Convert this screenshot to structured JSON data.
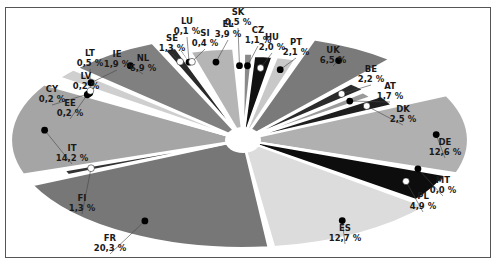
{
  "chart_data": {
    "type": "pie",
    "title": "",
    "style": "exploded elliptical pie with center hole, marker dots per slice",
    "unit": "%",
    "slices": [
      {
        "label": "HU",
        "value": 2.0,
        "value_text": "2,0 %",
        "color": "#111111",
        "dot": "white"
      },
      {
        "label": "PT",
        "value": 2.1,
        "value_text": "2,1 %",
        "color": "#c8c8c8",
        "dot": "black"
      },
      {
        "label": "UK",
        "value": 6.5,
        "value_text": "6,5 %",
        "color": "#7a7a7a",
        "dot": "black"
      },
      {
        "label": "BE",
        "value": 2.2,
        "value_text": "2,2 %",
        "color": "#2b2b2b",
        "dot": "white"
      },
      {
        "label": "AT",
        "value": 1.7,
        "value_text": "1,7 %",
        "color": "#9a9a9a",
        "dot": "black"
      },
      {
        "label": "DK",
        "value": 2.5,
        "value_text": "2,5 %",
        "color": "#1e1e1e",
        "dot": "white"
      },
      {
        "label": "DE",
        "value": 12.6,
        "value_text": "12,6 %",
        "color": "#b0b0b0",
        "dot": "black"
      },
      {
        "label": "MT",
        "value": 0.0,
        "value_text": "0,0 %",
        "color": "#444444",
        "dot": "black"
      },
      {
        "label": "PL",
        "value": 4.9,
        "value_text": "4,9 %",
        "color": "#0d0d0d",
        "dot": "white"
      },
      {
        "label": "ES",
        "value": 12.7,
        "value_text": "12,7 %",
        "color": "#dcdcdc",
        "dot": "black"
      },
      {
        "label": "FR",
        "value": 20.3,
        "value_text": "20,3 %",
        "color": "#777777",
        "dot": "black"
      },
      {
        "label": "FI",
        "value": 1.3,
        "value_text": "1,3 %",
        "color": "#333333",
        "dot": "white"
      },
      {
        "label": "IT",
        "value": 14.2,
        "value_text": "14,2 %",
        "color": "#a5a5a5",
        "dot": "black"
      },
      {
        "label": "EE",
        "value": 0.2,
        "value_text": "0,2 %",
        "color": "#555555",
        "dot": "black"
      },
      {
        "label": "CY",
        "value": 0.2,
        "value_text": "0,2 %",
        "color": "#222222",
        "dot": "black"
      },
      {
        "label": "LV",
        "value": 0.2,
        "value_text": "0,2 %",
        "color": "#888888",
        "dot": "black"
      },
      {
        "label": "LT",
        "value": 0.5,
        "value_text": "0,5 %",
        "color": "#111111",
        "dot": "white"
      },
      {
        "label": "IE",
        "value": 1.9,
        "value_text": "1,9 %",
        "color": "#cfcfcf",
        "dot": "black"
      },
      {
        "label": "NL",
        "value": 6.9,
        "value_text": "6,9 %",
        "color": "#808080",
        "dot": "black"
      },
      {
        "label": "SE",
        "value": 1.3,
        "value_text": "1,3 %",
        "color": "#2a2a2a",
        "dot": "white"
      },
      {
        "label": "LU",
        "value": 0.1,
        "value_text": "0,1 %",
        "color": "#101010",
        "dot": "black"
      },
      {
        "label": "SI",
        "value": 0.4,
        "value_text": "0,4 %",
        "color": "#3a3a3a",
        "dot": "white"
      },
      {
        "label": "EL",
        "value": 3.9,
        "value_text": "3,9 %",
        "color": "#b5b5b5",
        "dot": "black"
      },
      {
        "label": "SK",
        "value": 0.5,
        "value_text": "0,5 %",
        "color": "#333333",
        "dot": "black"
      },
      {
        "label": "CZ",
        "value": 1.1,
        "value_text": "1,1 %",
        "color": "#8a8a8a",
        "dot": "black"
      }
    ],
    "label_positions": {
      "HU": [
        272,
        31
      ],
      "PT": [
        296,
        36
      ],
      "UK": [
        333,
        44
      ],
      "BE": [
        371,
        63
      ],
      "AT": [
        390,
        80
      ],
      "DK": [
        403,
        103
      ],
      "DE": [
        445,
        136
      ],
      "MT": [
        443,
        174
      ],
      "PL": [
        423,
        190
      ],
      "ES": [
        345,
        222
      ],
      "FR": [
        110,
        232
      ],
      "FI": [
        82,
        192
      ],
      "IT": [
        72,
        142
      ],
      "EE": [
        70,
        97
      ],
      "CY": [
        52,
        83
      ],
      "LV": [
        86,
        70
      ],
      "LT": [
        90,
        47
      ],
      "IE": [
        117,
        48
      ],
      "NL": [
        143,
        52
      ],
      "SE": [
        172,
        32
      ],
      "LU": [
        187,
        15
      ],
      "SI": [
        205,
        27
      ],
      "EL": [
        228,
        18
      ],
      "SK": [
        238,
        6
      ],
      "CZ": [
        258,
        24
      ]
    }
  }
}
